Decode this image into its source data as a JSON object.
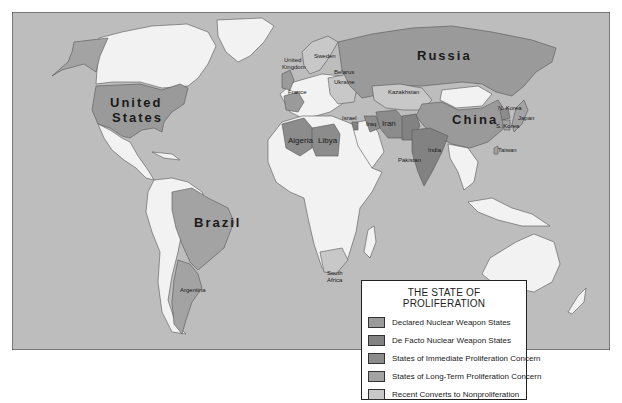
{
  "title": "THE STATE OF PROLIFERATION",
  "colors": {
    "ocean": "#bdbdbd",
    "land_default": "#f2f2f2",
    "border": "#555555",
    "declared": "#9a9a9a",
    "de_facto": "#828282",
    "immediate_concern": "#8c8c8c",
    "long_term_concern": "#a3a3a3",
    "recent_converts": "#c8c8c8"
  },
  "legend": {
    "title": "THE STATE OF PROLIFERATION",
    "items": [
      {
        "label": "Declared Nuclear Weapon States",
        "color": "#9a9a9a"
      },
      {
        "label": "De Facto Nuclear Weapon States",
        "color": "#828282"
      },
      {
        "label": "States of Immediate Proliferation Concern",
        "color": "#8c8c8c"
      },
      {
        "label": "States of Long-Term Proliferation Concern",
        "color": "#a3a3a3"
      },
      {
        "label": "Recent Converts to Nonproliferation",
        "color": "#c8c8c8"
      }
    ]
  },
  "labels": {
    "united_states": [
      "United",
      "States"
    ],
    "russia": "Russia",
    "china": "China",
    "brazil": "Brazil",
    "argentina": "Argentina",
    "south_africa": [
      "South",
      "Africa"
    ],
    "united_kingdom": [
      "United",
      "Kingdom"
    ],
    "france": "France",
    "sweden": "Sweden",
    "belarus": "Belarus",
    "ukraine": "Ukraine",
    "kazakhstan": "Kazakhstan",
    "algeria": "Algeria",
    "libya": "Libya",
    "israel": "Israel",
    "iraq": "Iraq",
    "iran": "Iran",
    "pakistan": "Pakistan",
    "india": "India",
    "n_korea": "N. Korea",
    "s_korea": "S. Korea",
    "japan": "Japan",
    "taiwan": "Taiwan"
  }
}
